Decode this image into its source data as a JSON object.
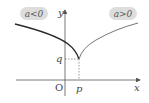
{
  "diagram": {
    "labels": {
      "left_curve": "a<0",
      "right_curve": "a>0",
      "y_axis": "y",
      "x_axis": "x",
      "origin": "O",
      "p": "p",
      "q": "q"
    },
    "colors": {
      "axis": "#555555",
      "curve_left": "#2a2a2a",
      "curve_right": "#666666",
      "pill_bg": "#dddddd",
      "dashed": "#555555"
    }
  }
}
